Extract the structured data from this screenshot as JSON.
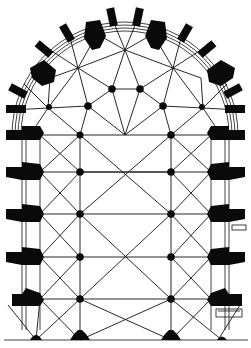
{
  "figure": {
    "type": "architectural-floor-plan",
    "colors": {
      "ink": "#0a0a0a",
      "paper": "#ffffff"
    }
  },
  "geometry": {
    "apse_center": [
      125,
      135
    ],
    "nave_columns": [
      [
        80,
        135
      ],
      [
        171,
        135
      ],
      [
        80,
        172
      ],
      [
        171,
        172
      ],
      [
        80,
        214
      ],
      [
        171,
        214
      ],
      [
        80,
        257
      ],
      [
        171,
        257
      ],
      [
        80,
        299
      ],
      [
        171,
        299
      ]
    ],
    "ambulatory_columns": [
      [
        88,
        106
      ],
      [
        112,
        89
      ],
      [
        140,
        89
      ],
      [
        163,
        106
      ]
    ],
    "chapel_centers": [
      [
        48,
        108
      ],
      [
        78,
        68
      ],
      [
        125,
        50
      ],
      [
        173,
        68
      ],
      [
        203,
        108
      ]
    ],
    "outer_piers_left_y": [
      135,
      172,
      214,
      257,
      299
    ],
    "outer_piers_right_y": [
      135,
      172,
      214,
      257,
      299
    ],
    "bottom_piers": [
      [
        36,
        340
      ],
      [
        80,
        340
      ],
      [
        171,
        340
      ],
      [
        222,
        340
      ]
    ]
  }
}
